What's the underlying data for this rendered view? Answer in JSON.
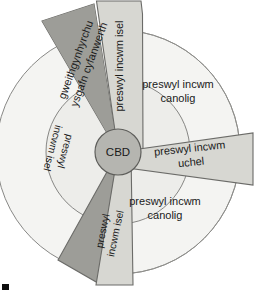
{
  "diagram": {
    "center": {
      "label": "CBD",
      "name": "central-business-district"
    },
    "colors": {
      "background": "#ffffff",
      "outer_ring": "#f4f4f2",
      "inner_ring": "#ededea",
      "mid_wedge": "#d7d7d2",
      "dark_wedge": "#9d9d98",
      "cbd_fill": "#b5b5b0",
      "stroke": "#6b6b68",
      "text": "#1a1a1a",
      "corner_mark": "#0d0d0d"
    },
    "sectors": [
      {
        "id": "manufacturing-wholesale",
        "label_line1": "gweithgynhyrchu",
        "label_line2": "ysgafn cyfanwerth",
        "tone": "dark"
      },
      {
        "id": "low-income-residential-top",
        "label": "preswyl incwm isel",
        "tone": "mid"
      },
      {
        "id": "middle-income-residential-upper",
        "label_line1": "preswyl incwm",
        "label_line2": "canolig",
        "tone": "light"
      },
      {
        "id": "high-income-residential",
        "label_line1": "preswyl incwm",
        "label_line2": "uchel",
        "tone": "mid"
      },
      {
        "id": "middle-income-residential-lower",
        "label_line1": "preswyl incwm",
        "label_line2": "canolig",
        "tone": "light"
      },
      {
        "id": "low-income-residential-bottom",
        "label_line1": "preswyl",
        "label_line2": "incwm isel",
        "tone": "mid"
      },
      {
        "id": "low-income-residential-left",
        "label_line1": "preswyl",
        "label_line2": "incwm isel",
        "tone": "light"
      }
    ]
  }
}
